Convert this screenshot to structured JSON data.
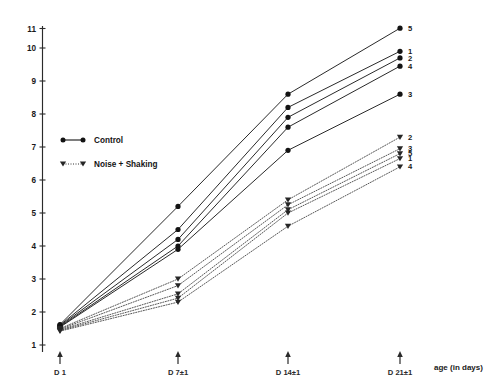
{
  "chart_data": {
    "type": "line",
    "title": "",
    "subtitle": "",
    "xlabel": "age (in days)",
    "ylabel": "",
    "x": [
      1,
      7,
      14,
      21
    ],
    "categories": [
      "D 1",
      "D 7±1",
      "D 14±1",
      "D 21±1"
    ],
    "xlim": [
      0,
      23
    ],
    "ylim": [
      1,
      11
    ],
    "grid": false,
    "legend_position": "upper-left-inside",
    "ytick_labels": [
      "11",
      "10",
      "9",
      "8",
      "7",
      "6",
      "5",
      "4",
      "3",
      "2",
      "1"
    ],
    "ytick_values": [
      11,
      10,
      9,
      8,
      7,
      6,
      5,
      4,
      3,
      2,
      1
    ],
    "legend": [
      {
        "label": "Control",
        "marker": "filled-circle",
        "line": "solid"
      },
      {
        "label": "Noise + Shaking",
        "marker": "filled-triangle-down",
        "line": "dotted"
      }
    ],
    "groups": [
      {
        "name": "Control",
        "line": "solid",
        "marker": "filled-circle",
        "series": [
          {
            "name": "5",
            "end_label": "5",
            "values": [
              1.62,
              5.2,
              8.6,
              10.6
            ]
          },
          {
            "name": "1",
            "end_label": "1",
            "values": [
              1.6,
              4.5,
              8.2,
              9.9
            ]
          },
          {
            "name": "2",
            "end_label": "2",
            "values": [
              1.58,
              4.2,
              7.9,
              9.7
            ]
          },
          {
            "name": "4",
            "end_label": "4",
            "values": [
              1.56,
              4.0,
              7.6,
              9.45
            ]
          },
          {
            "name": "3",
            "end_label": "3",
            "values": [
              1.54,
              3.9,
              6.9,
              8.6
            ]
          }
        ]
      },
      {
        "name": "Noise + Shaking",
        "line": "dotted",
        "marker": "filled-triangle-down",
        "series": [
          {
            "name": "2",
            "end_label": "2",
            "values": [
              1.5,
              3.0,
              5.4,
              7.3
            ]
          },
          {
            "name": "3",
            "end_label": "3",
            "values": [
              1.48,
              2.8,
              5.25,
              6.95
            ]
          },
          {
            "name": "5",
            "end_label": "5",
            "values": [
              1.46,
              2.55,
              5.1,
              6.8
            ]
          },
          {
            "name": "1",
            "end_label": "1",
            "values": [
              1.44,
              2.42,
              5.0,
              6.65
            ]
          },
          {
            "name": "4",
            "end_label": "4",
            "values": [
              1.42,
              2.3,
              4.6,
              6.4
            ]
          }
        ]
      }
    ],
    "end_label_clusters": [
      {
        "label": "5",
        "group": "Control"
      },
      {
        "label": "1",
        "group": "Control"
      },
      {
        "label": "2",
        "group": "Control"
      },
      {
        "label": "4",
        "group": "Control"
      },
      {
        "label": "3",
        "group": "Control"
      },
      {
        "label": "2",
        "group": "Noise + Shaking"
      },
      {
        "label": "3",
        "group": "Noise + Shaking"
      },
      {
        "label": "5",
        "group": "Noise + Shaking"
      },
      {
        "label": "1",
        "group": "Noise + Shaking"
      },
      {
        "label": "4",
        "group": "Noise + Shaking"
      }
    ],
    "colors": {
      "control_line": "#1d1d1d",
      "noise_line": "#3a3a3a",
      "axis": "#2b2b2b",
      "text": "#1a1a1a",
      "background": "#ffffff"
    }
  },
  "axis": {
    "x_title": "age (in days)",
    "x_ticks": [
      "D 1",
      "D 7±1",
      "D 14±1",
      "D 21±1"
    ],
    "y_ticks": [
      "11",
      "10",
      "9",
      "8",
      "7",
      "6",
      "5",
      "4",
      "3",
      "2",
      "1"
    ]
  },
  "legend": {
    "control_label": "Control",
    "noise_label": "Noise + Shaking"
  }
}
